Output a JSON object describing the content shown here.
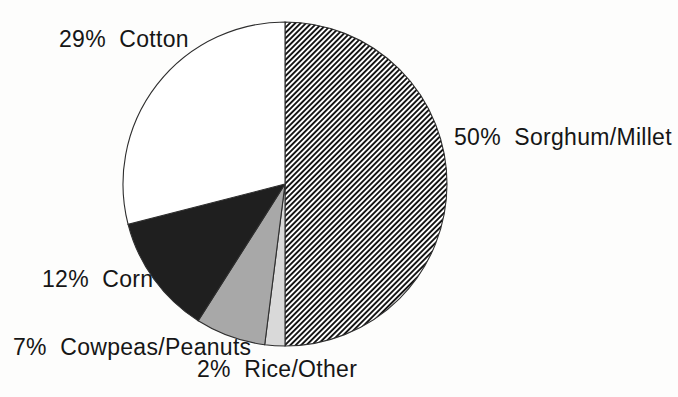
{
  "figure": {
    "kind": "scanned pie chart figure",
    "background_color": "#fdfdfc",
    "text_color": "#161616"
  },
  "chart_data": {
    "type": "pie",
    "title": "",
    "legend_position": "none",
    "labels_outside": true,
    "start_angle_deg": 0,
    "direction": "clockwise",
    "outline_color": "#2e2e2e",
    "slices": [
      {
        "name": "Sorghum/Millet",
        "value": 50,
        "label": "50%  Sorghum/Millet",
        "fill": "diagonal-hatch"
      },
      {
        "name": "Rice/Other",
        "value": 2,
        "label": "2%  Rice/Other",
        "fill": "#d9d9d9"
      },
      {
        "name": "Cowpeas/Peanuts",
        "value": 7,
        "label": "7%  Cowpeas/Peanuts",
        "fill": "#a8a8a8"
      },
      {
        "name": "Corn",
        "value": 12,
        "label": "12%  Corn",
        "fill": "#1f1f1f"
      },
      {
        "name": "Cotton",
        "value": 29,
        "label": "29%  Cotton",
        "fill": "#ffffff"
      }
    ]
  }
}
